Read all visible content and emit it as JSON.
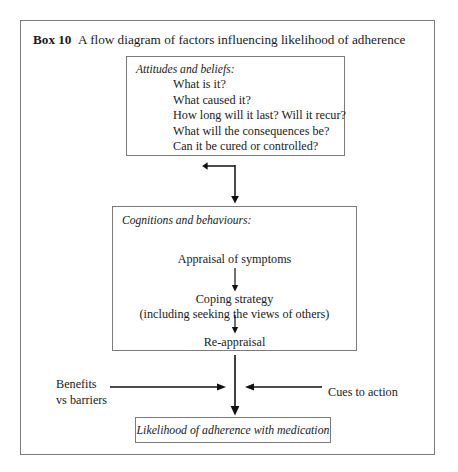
{
  "figure": {
    "label": "Box 10",
    "caption": "A  flow diagram of factors influencing likelihood of adherence",
    "frame_color": "#7b7b7b",
    "text_color": "#1a1a1a",
    "background": "#ffffff"
  },
  "boxes": {
    "attitudes": {
      "heading": "Attitudes and beliefs:",
      "items": [
        "What is it?",
        "What caused it?",
        "How long will it last? Will it recur?",
        "What will the consequences be?",
        "Can it be cured or controlled?"
      ]
    },
    "cognitions": {
      "heading": "Cognitions and behaviours:",
      "step_1": "Appraisal of symptoms",
      "step_2": "Coping strategy",
      "step_2_sub": "(including seeking the views of others)",
      "step_3": "Re-appraisal"
    },
    "outcome": {
      "text": "Likelihood of adherence with medication"
    }
  },
  "side_inputs": {
    "left_label_line1": "Benefits",
    "left_label_line2": "vs barriers",
    "right_label": "Cues to action"
  },
  "connectors": [
    {
      "name": "attitudes-to-cognitions",
      "direction": "down"
    },
    {
      "name": "appraisal-to-coping",
      "direction": "down"
    },
    {
      "name": "coping-to-reappraisal",
      "direction": "down"
    },
    {
      "name": "cognitions-to-outcome",
      "direction": "down"
    },
    {
      "name": "benefits-into-spine",
      "direction": "right"
    },
    {
      "name": "cues-into-spine",
      "direction": "left"
    }
  ]
}
